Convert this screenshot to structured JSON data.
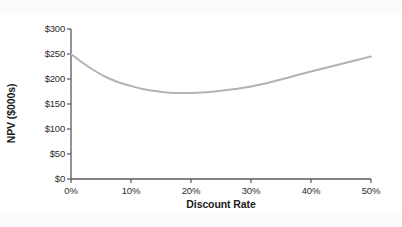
{
  "chart_data": {
    "type": "line",
    "title": "",
    "subtitle": "",
    "xlabel": "Discount Rate",
    "ylabel": "NPV ($000s)",
    "xlim": [
      0,
      50
    ],
    "ylim": [
      0,
      300
    ],
    "x_tick_labels": [
      "0%",
      "10%",
      "20%",
      "30%",
      "40%",
      "50%"
    ],
    "x_ticks": [
      0,
      10,
      20,
      30,
      40,
      50
    ],
    "y_tick_labels": [
      "$0",
      "$50",
      "$100",
      "$150",
      "$200",
      "$250",
      "$300"
    ],
    "y_ticks": [
      0,
      50,
      100,
      150,
      200,
      250,
      300
    ],
    "grid": false,
    "legend": false,
    "legend_position": "none",
    "annotations": [],
    "series": [
      {
        "name": "NPV",
        "color": "#b3b3b3",
        "line_width": 2,
        "x": [
          0,
          2,
          4,
          6,
          8,
          10,
          12,
          14,
          16,
          18,
          20,
          22,
          24,
          26,
          28,
          30,
          32,
          34,
          36,
          38,
          40,
          42,
          44,
          46,
          48,
          50
        ],
        "values": [
          250,
          232,
          216,
          203,
          193,
          186,
          180,
          176,
          173,
          172,
          172,
          173,
          175,
          178,
          181,
          185,
          190,
          196,
          202,
          209,
          215,
          221,
          227,
          233,
          239,
          245
        ]
      }
    ]
  },
  "axes": {
    "y_axis_line_color": "#595959",
    "x_axis_line_color": "#595959",
    "tick_color": "#595959"
  },
  "figure": {
    "background": "#ffffff"
  }
}
